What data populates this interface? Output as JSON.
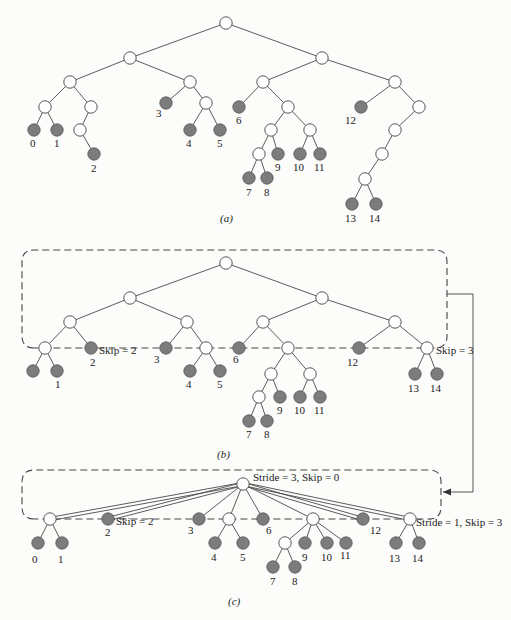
{
  "figure": {
    "colors": {
      "edge": "#4a4a4a",
      "leaf_fill": "#7c7c7c",
      "internal_fill": "#ffffff",
      "background": "#fcfcfa"
    },
    "panels": [
      {
        "id": "a",
        "caption": "(a)",
        "caption_pos": [
          220,
          222
        ],
        "nodes": [
          {
            "id": "r",
            "x": 226,
            "y": 23,
            "t": "i"
          },
          {
            "id": "L",
            "x": 130,
            "y": 58,
            "t": "i"
          },
          {
            "id": "R",
            "x": 322,
            "y": 58,
            "t": "i"
          },
          {
            "id": "LL",
            "x": 70,
            "y": 82,
            "t": "i"
          },
          {
            "id": "LR",
            "x": 190,
            "y": 82,
            "t": "i"
          },
          {
            "id": "RL",
            "x": 263,
            "y": 82,
            "t": "i"
          },
          {
            "id": "RR",
            "x": 395,
            "y": 82,
            "t": "i"
          },
          {
            "id": "a1",
            "x": 45,
            "y": 107,
            "t": "i"
          },
          {
            "id": "a2",
            "x": 91,
            "y": 107,
            "t": "i"
          },
          {
            "id": "n3",
            "x": 166,
            "y": 103,
            "t": "l",
            "label": "3",
            "lx": 156,
            "ly": 117
          },
          {
            "id": "a3",
            "x": 206,
            "y": 103,
            "t": "i"
          },
          {
            "id": "n6",
            "x": 239,
            "y": 107,
            "t": "l",
            "label": "6",
            "lx": 236,
            "ly": 124
          },
          {
            "id": "a4",
            "x": 288,
            "y": 107,
            "t": "i"
          },
          {
            "id": "n12",
            "x": 361,
            "y": 107,
            "t": "l",
            "label": "12",
            "lx": 345,
            "ly": 124
          },
          {
            "id": "a5",
            "x": 419,
            "y": 107,
            "t": "i"
          },
          {
            "id": "n0",
            "x": 34,
            "y": 130,
            "t": "l",
            "label": "0",
            "lx": 30,
            "ly": 147
          },
          {
            "id": "n1",
            "x": 57,
            "y": 130,
            "t": "l",
            "label": "1",
            "lx": 54,
            "ly": 147
          },
          {
            "id": "a6",
            "x": 80,
            "y": 130,
            "t": "i"
          },
          {
            "id": "n4",
            "x": 190,
            "y": 130,
            "t": "l",
            "label": "4",
            "lx": 186,
            "ly": 147
          },
          {
            "id": "n5",
            "x": 220,
            "y": 130,
            "t": "l",
            "label": "5",
            "lx": 217,
            "ly": 147
          },
          {
            "id": "a7",
            "x": 271,
            "y": 130,
            "t": "i"
          },
          {
            "id": "a8",
            "x": 310,
            "y": 130,
            "t": "i"
          },
          {
            "id": "a9",
            "x": 395,
            "y": 130,
            "t": "i"
          },
          {
            "id": "n2",
            "x": 94,
            "y": 154,
            "t": "l",
            "label": "2",
            "lx": 91,
            "ly": 172
          },
          {
            "id": "a10",
            "x": 259,
            "y": 154,
            "t": "i"
          },
          {
            "id": "n9",
            "x": 278,
            "y": 154,
            "t": "l",
            "label": "9",
            "lx": 275,
            "ly": 171
          },
          {
            "id": "n10",
            "x": 300,
            "y": 154,
            "t": "l",
            "label": "10",
            "lx": 293,
            "ly": 171
          },
          {
            "id": "n11",
            "x": 320,
            "y": 154,
            "t": "l",
            "label": "11",
            "lx": 314,
            "ly": 171
          },
          {
            "id": "a11",
            "x": 382,
            "y": 154,
            "t": "i"
          },
          {
            "id": "a12",
            "x": 365,
            "y": 179,
            "t": "i"
          },
          {
            "id": "n7",
            "x": 249,
            "y": 178,
            "t": "l",
            "label": "7",
            "lx": 246,
            "ly": 196
          },
          {
            "id": "n8",
            "x": 267,
            "y": 178,
            "t": "l",
            "label": "8",
            "lx": 264,
            "ly": 196
          },
          {
            "id": "n13",
            "x": 352,
            "y": 204,
            "t": "l",
            "label": "13",
            "lx": 345,
            "ly": 222
          },
          {
            "id": "n14",
            "x": 376,
            "y": 204,
            "t": "l",
            "label": "14",
            "lx": 369,
            "ly": 222
          }
        ],
        "edges": [
          [
            "r",
            "L"
          ],
          [
            "r",
            "R"
          ],
          [
            "L",
            "LL"
          ],
          [
            "L",
            "LR"
          ],
          [
            "R",
            "RL"
          ],
          [
            "R",
            "RR"
          ],
          [
            "LL",
            "a1"
          ],
          [
            "LL",
            "a2"
          ],
          [
            "LR",
            "n3"
          ],
          [
            "LR",
            "a3"
          ],
          [
            "RL",
            "n6"
          ],
          [
            "RL",
            "a4"
          ],
          [
            "RR",
            "n12"
          ],
          [
            "RR",
            "a5"
          ],
          [
            "a1",
            "n0"
          ],
          [
            "a1",
            "n1"
          ],
          [
            "a2",
            "a6"
          ],
          [
            "a3",
            "n4"
          ],
          [
            "a3",
            "n5"
          ],
          [
            "a4",
            "a7"
          ],
          [
            "a4",
            "a8"
          ],
          [
            "a5",
            "a9"
          ],
          [
            "a6",
            "n2"
          ],
          [
            "a7",
            "a10"
          ],
          [
            "a7",
            "n9"
          ],
          [
            "a8",
            "n10"
          ],
          [
            "a8",
            "n11"
          ],
          [
            "a9",
            "a11"
          ],
          [
            "a11",
            "a12"
          ],
          [
            "a10",
            "n7"
          ],
          [
            "a10",
            "n8"
          ],
          [
            "a12",
            "n13"
          ],
          [
            "a12",
            "n14"
          ]
        ]
      },
      {
        "id": "b",
        "caption": "(b)",
        "caption_pos": [
          217,
          458
        ],
        "box": {
          "x": 22,
          "y": 250,
          "w": 175,
          "h": 98,
          "x2": 447,
          "r": 12
        },
        "nodes": [
          {
            "id": "r",
            "x": 226,
            "y": 263,
            "t": "i"
          },
          {
            "id": "L",
            "x": 130,
            "y": 298,
            "t": "i"
          },
          {
            "id": "R",
            "x": 322,
            "y": 298,
            "t": "i"
          },
          {
            "id": "LL",
            "x": 70,
            "y": 322,
            "t": "i"
          },
          {
            "id": "LR",
            "x": 187,
            "y": 322,
            "t": "i"
          },
          {
            "id": "RL",
            "x": 263,
            "y": 322,
            "t": "i"
          },
          {
            "id": "RR",
            "x": 395,
            "y": 322,
            "t": "i"
          },
          {
            "id": "a1",
            "x": 45,
            "y": 348,
            "t": "i"
          },
          {
            "id": "n2",
            "x": 91,
            "y": 348,
            "t": "l",
            "label": "2",
            "lx": 90,
            "ly": 366
          },
          {
            "id": "n3",
            "x": 166,
            "y": 348,
            "t": "l",
            "label": "3",
            "lx": 154,
            "ly": 363
          },
          {
            "id": "a3",
            "x": 206,
            "y": 348,
            "t": "i"
          },
          {
            "id": "n6",
            "x": 239,
            "y": 348,
            "t": "l",
            "label": "6",
            "lx": 233,
            "ly": 363
          },
          {
            "id": "a4",
            "x": 288,
            "y": 348,
            "t": "i"
          },
          {
            "id": "n12",
            "x": 359,
            "y": 348,
            "t": "l",
            "label": "12",
            "lx": 347,
            "ly": 366
          },
          {
            "id": "a5",
            "x": 427,
            "y": 348,
            "t": "i"
          },
          {
            "id": "n0",
            "x": 33,
            "y": 371,
            "t": "l"
          },
          {
            "id": "n1",
            "x": 57,
            "y": 371,
            "t": "l",
            "label": "1",
            "lx": 55,
            "ly": 388
          },
          {
            "id": "n4",
            "x": 190,
            "y": 371,
            "t": "l",
            "label": "4",
            "lx": 186,
            "ly": 388
          },
          {
            "id": "n5",
            "x": 220,
            "y": 371,
            "t": "l",
            "label": "5",
            "lx": 217,
            "ly": 388
          },
          {
            "id": "a7",
            "x": 271,
            "y": 374,
            "t": "i"
          },
          {
            "id": "a8",
            "x": 310,
            "y": 374,
            "t": "i"
          },
          {
            "id": "n13",
            "x": 415,
            "y": 374,
            "t": "l",
            "label": "13",
            "lx": 408,
            "ly": 392
          },
          {
            "id": "n14",
            "x": 437,
            "y": 374,
            "t": "l",
            "label": "14",
            "lx": 430,
            "ly": 392
          },
          {
            "id": "a10",
            "x": 259,
            "y": 397,
            "t": "i"
          },
          {
            "id": "n9",
            "x": 280,
            "y": 397,
            "t": "l",
            "label": "9",
            "lx": 277,
            "ly": 414
          },
          {
            "id": "n10",
            "x": 300,
            "y": 397,
            "t": "l",
            "label": "10",
            "lx": 294,
            "ly": 414
          },
          {
            "id": "n11",
            "x": 320,
            "y": 397,
            "t": "l",
            "label": "11",
            "lx": 314,
            "ly": 414
          },
          {
            "id": "n7",
            "x": 249,
            "y": 421,
            "t": "l",
            "label": "7",
            "lx": 246,
            "ly": 438
          },
          {
            "id": "n8",
            "x": 267,
            "y": 421,
            "t": "l",
            "label": "8",
            "lx": 264,
            "ly": 438
          }
        ],
        "edges": [
          [
            "r",
            "L"
          ],
          [
            "r",
            "R"
          ],
          [
            "L",
            "LL"
          ],
          [
            "L",
            "LR"
          ],
          [
            "R",
            "RL"
          ],
          [
            "R",
            "RR"
          ],
          [
            "LL",
            "a1"
          ],
          [
            "LL",
            "n2"
          ],
          [
            "LR",
            "n3"
          ],
          [
            "LR",
            "a3"
          ],
          [
            "RL",
            "n6"
          ],
          [
            "RL",
            "a4"
          ],
          [
            "RR",
            "n12"
          ],
          [
            "RR",
            "a5"
          ],
          [
            "a1",
            "n0"
          ],
          [
            "a1",
            "n1"
          ],
          [
            "a3",
            "n4"
          ],
          [
            "a3",
            "n5"
          ],
          [
            "a4",
            "a7"
          ],
          [
            "a4",
            "a8"
          ],
          [
            "a5",
            "n13"
          ],
          [
            "a5",
            "n14"
          ],
          [
            "a7",
            "a10"
          ],
          [
            "a7",
            "n9"
          ],
          [
            "a8",
            "n10"
          ],
          [
            "a8",
            "n11"
          ],
          [
            "a10",
            "n7"
          ],
          [
            "a10",
            "n8"
          ]
        ],
        "annotations": [
          {
            "text": "Skip = 2",
            "x": 99,
            "y": 354
          },
          {
            "text": "Skip = 3",
            "x": 436,
            "y": 354
          }
        ]
      },
      {
        "id": "c",
        "caption": "(c)",
        "caption_pos": [
          228,
          605
        ],
        "box": {
          "x": 22,
          "y": 470,
          "x2": 441,
          "y2": 519,
          "r": 12
        },
        "nodes": [
          {
            "id": "r",
            "x": 243,
            "y": 484,
            "t": "i"
          },
          {
            "id": "a1",
            "x": 50,
            "y": 519,
            "t": "i"
          },
          {
            "id": "n2",
            "x": 108,
            "y": 519,
            "t": "l",
            "label": "2",
            "lx": 105,
            "ly": 536
          },
          {
            "id": "n3",
            "x": 199,
            "y": 519,
            "t": "l",
            "label": "3",
            "lx": 188,
            "ly": 534
          },
          {
            "id": "a3",
            "x": 229,
            "y": 519,
            "t": "i"
          },
          {
            "id": "n6",
            "x": 263,
            "y": 519,
            "t": "l",
            "label": "6",
            "lx": 266,
            "ly": 534
          },
          {
            "id": "a4",
            "x": 313,
            "y": 519,
            "t": "i"
          },
          {
            "id": "n12",
            "x": 363,
            "y": 519,
            "t": "l",
            "label": "12",
            "lx": 370,
            "ly": 534
          },
          {
            "id": "a5",
            "x": 410,
            "y": 519,
            "t": "i"
          },
          {
            "id": "n0",
            "x": 38,
            "y": 543,
            "t": "l",
            "label": "0",
            "lx": 32,
            "ly": 563
          },
          {
            "id": "n1",
            "x": 62,
            "y": 543,
            "t": "l",
            "label": "1",
            "lx": 58,
            "ly": 563
          },
          {
            "id": "n4",
            "x": 215,
            "y": 543,
            "t": "l",
            "label": "4",
            "lx": 211,
            "ly": 561
          },
          {
            "id": "n5",
            "x": 243,
            "y": 543,
            "t": "l",
            "label": "5",
            "lx": 240,
            "ly": 561
          },
          {
            "id": "a10",
            "x": 285,
            "y": 543,
            "t": "i"
          },
          {
            "id": "n9",
            "x": 305,
            "y": 543,
            "t": "l",
            "label": "9",
            "lx": 302,
            "ly": 561
          },
          {
            "id": "n10",
            "x": 327,
            "y": 543,
            "t": "l",
            "label": "10",
            "lx": 321,
            "ly": 561
          },
          {
            "id": "n11",
            "x": 346,
            "y": 543,
            "t": "l",
            "label": "11",
            "lx": 340,
            "ly": 559
          },
          {
            "id": "n13",
            "x": 396,
            "y": 543,
            "t": "l",
            "label": "13",
            "lx": 389,
            "ly": 562
          },
          {
            "id": "n14",
            "x": 419,
            "y": 543,
            "t": "l",
            "label": "14",
            "lx": 412,
            "ly": 562
          },
          {
            "id": "n7",
            "x": 273,
            "y": 567,
            "t": "l",
            "label": "7",
            "lx": 270,
            "ly": 585
          },
          {
            "id": "n8",
            "x": 295,
            "y": 567,
            "t": "l",
            "label": "8",
            "lx": 292,
            "ly": 585
          }
        ],
        "edges": [
          [
            "r",
            "n3"
          ],
          [
            "r",
            "a3"
          ],
          [
            "r",
            "n6"
          ],
          [
            "r",
            "a4"
          ],
          [
            "a1",
            "n0"
          ],
          [
            "a1",
            "n1"
          ],
          [
            "a3",
            "n4"
          ],
          [
            "a3",
            "n5"
          ],
          [
            "a4",
            "a10"
          ],
          [
            "a4",
            "n9"
          ],
          [
            "a4",
            "n10"
          ],
          [
            "a4",
            "n11"
          ],
          [
            "a5",
            "n13"
          ],
          [
            "a5",
            "n14"
          ],
          [
            "a10",
            "n7"
          ],
          [
            "a10",
            "n8"
          ]
        ],
        "double_edges": [
          [
            "r",
            "a1"
          ],
          [
            "r",
            "n2"
          ],
          [
            "r",
            "n12"
          ],
          [
            "r",
            "a5"
          ]
        ],
        "annotations": [
          {
            "text": "Stride = 3,  Skip = 0",
            "x": 253,
            "y": 481
          },
          {
            "text": "Skip = 2",
            "x": 116,
            "y": 525
          },
          {
            "text": "Stride = 1, Skip = 3",
            "x": 416,
            "y": 526
          }
        ]
      }
    ],
    "connector": {
      "points": [
        [
          447,
          294
        ],
        [
          473,
          294
        ],
        [
          473,
          492
        ],
        [
          443,
          492
        ]
      ]
    }
  }
}
